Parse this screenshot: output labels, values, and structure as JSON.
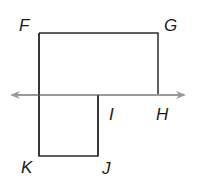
{
  "diagram": {
    "type": "geometry",
    "colors": {
      "figure_stroke": "#2b2b2b",
      "line_stroke": "#9a9a9a",
      "label": "#1a1a1a"
    },
    "points": {
      "F": {
        "label": "F",
        "x": 39,
        "y": 33
      },
      "G": {
        "label": "G",
        "x": 158,
        "y": 33
      },
      "H": {
        "label": "H",
        "x": 158,
        "y": 95
      },
      "I": {
        "label": "I",
        "x": 98,
        "y": 95
      },
      "J": {
        "label": "J",
        "x": 98,
        "y": 156
      },
      "K": {
        "label": "K",
        "x": 39,
        "y": 156
      }
    },
    "line": {
      "name": "line HI",
      "arrows": "both"
    }
  }
}
